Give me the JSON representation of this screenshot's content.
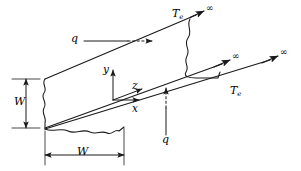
{
  "figure": {
    "stroke_color": "#1a1a1a",
    "background_color": "#ffffff",
    "labels": {
      "temperature_top": {
        "symbol": "T",
        "subscript": "e",
        "x": 173,
        "y": 11
      },
      "temperature_right": {
        "symbol": "T",
        "subscript": "e",
        "x": 231,
        "y": 88
      },
      "flux_top": {
        "symbol": "q",
        "x": 74,
        "y": 36
      },
      "flux_bottom": {
        "symbol": "q",
        "x": 168,
        "y": 137
      },
      "axis_y": {
        "symbol": "y",
        "x": 110,
        "y": 69
      },
      "axis_z": {
        "symbol": "z",
        "x": 136,
        "y": 88
      },
      "axis_x": {
        "symbol": "x",
        "x": 136,
        "y": 110
      },
      "width_vertical": {
        "symbol": "W",
        "x": 20,
        "y": 97
      },
      "width_horizontal": {
        "symbol": "W",
        "x": 77,
        "y": 150
      },
      "infinity_top": {
        "symbol": "∞",
        "x": 207,
        "y": 9
      },
      "infinity_middle": {
        "symbol": "∞",
        "x": 233,
        "y": 57
      },
      "infinity_bottom": {
        "symbol": "∞",
        "x": 281,
        "y": 53
      }
    },
    "elements": [
      "plate-top-edge",
      "plate-bottom-edge",
      "plate-left-wavy-edge",
      "plate-bottom-wavy-edge",
      "plate-right-wavy-edge",
      "axis-y-arrow",
      "axis-z-arrow",
      "axis-x-arrow",
      "flux-top-arrow",
      "flux-bottom-arrow",
      "infinity-arrow-top",
      "infinity-arrow-middle",
      "infinity-arrow-bottom",
      "dimension-width-vertical",
      "dimension-width-horizontal"
    ]
  }
}
